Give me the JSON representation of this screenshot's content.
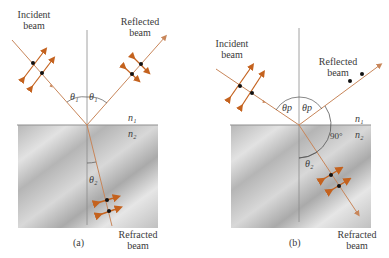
{
  "panels": [
    {
      "id": "a",
      "caption": "(a)",
      "incident_label_1": "Incident",
      "incident_label_2": "beam",
      "reflected_label_1": "Reflected",
      "reflected_label_2": "beam",
      "refracted_label_1": "Refracted",
      "refracted_label_2": "beam",
      "angle_incident": "θ₁",
      "angle_reflected": "θ₁",
      "angle_refracted": "θ₂",
      "medium_top": "n₁",
      "medium_bottom": "n₂"
    },
    {
      "id": "b",
      "caption": "(b)",
      "incident_label_1": "Incident",
      "incident_label_2": "beam",
      "reflected_label_1": "Reflected",
      "reflected_label_2": "beam",
      "refracted_label_1": "Refracted",
      "refracted_label_2": "beam",
      "angle_incident": "θp",
      "angle_reflected": "θp",
      "angle_refracted": "θ₂",
      "angle_right": "90°",
      "medium_top": "n₁",
      "medium_bottom": "n₂"
    }
  ],
  "colors": {
    "beam": "#c8865a",
    "arrow": "#c4621e",
    "normal": "#8a8a8a",
    "surface": "#9a9a9a",
    "medium": "#bdbdbd",
    "dot": "#111111"
  }
}
